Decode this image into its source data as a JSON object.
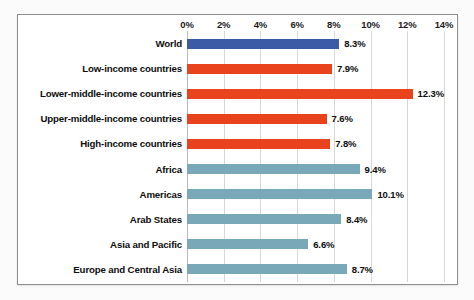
{
  "chart_data": {
    "type": "bar",
    "orientation": "horizontal",
    "title": "",
    "xlabel": "",
    "ylabel": "",
    "xlim": [
      0,
      14
    ],
    "xtick_labels": [
      "0%",
      "2%",
      "4%",
      "6%",
      "8%",
      "10%",
      "12%",
      "14%"
    ],
    "xticks": [
      0,
      2,
      4,
      6,
      8,
      10,
      12,
      14
    ],
    "grid": true,
    "legend": "none",
    "value_suffix": "%",
    "categories": [
      "World",
      "Low-income countries",
      "Lower-middle-income countries",
      "Upper-middle-income countries",
      "High-income countries",
      "Africa",
      "Americas",
      "Arab States",
      "Asia and Pacific",
      "Europe and Central Asia"
    ],
    "values": [
      8.3,
      7.9,
      12.3,
      7.6,
      7.8,
      9.4,
      10.1,
      8.4,
      6.6,
      8.7
    ],
    "data_labels": [
      "8.3%",
      "7.9%",
      "12.3%",
      "7.6%",
      "7.8%",
      "9.4%",
      "10.1%",
      "8.4%",
      "6.6%",
      "8.7%"
    ],
    "bar_colors": [
      "#3B5BA6",
      "#E8431D",
      "#E8431D",
      "#E8431D",
      "#E8431D",
      "#79A8B8",
      "#79A8B8",
      "#79A8B8",
      "#79A8B8",
      "#79A8B8"
    ],
    "colors": {
      "world": "#3B5BA6",
      "income_group": "#E8431D",
      "region": "#79A8B8",
      "gridline": "#D7D7D7",
      "frame": "#8D8D8D",
      "text": "#0D0D0D",
      "background": "#FFFFFF"
    }
  }
}
